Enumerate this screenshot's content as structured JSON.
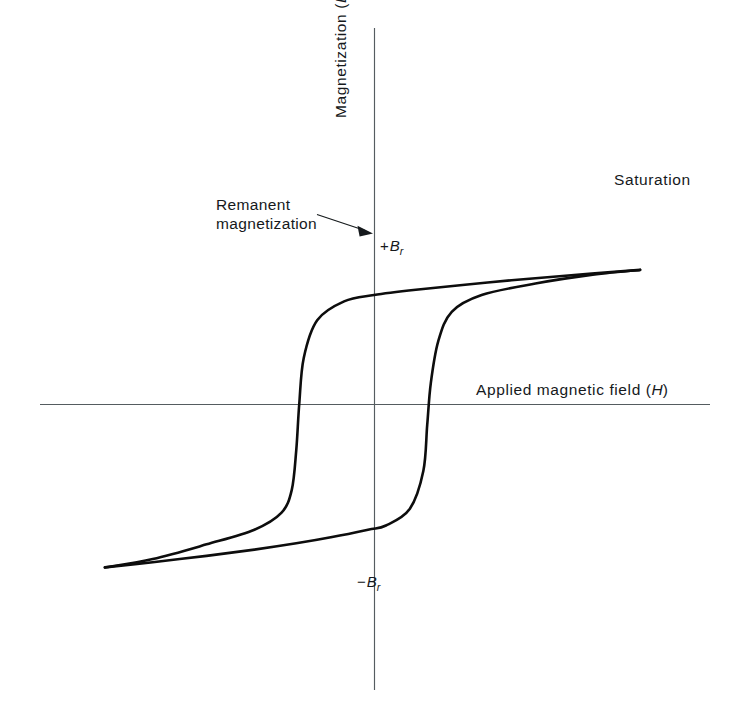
{
  "figure": {
    "kind": "hysteresis-loop-diagram",
    "background_color": "#ffffff",
    "ink_color": "#0d0d0d",
    "axis_color": "#555c60"
  },
  "axes": {
    "y_label_prefix": "Magnetization (",
    "y_label_symbol": "B",
    "y_label_suffix": ")",
    "y_label_full": "Magnetization (B)",
    "x_label_prefix": "Applied magnetic field (",
    "x_label_symbol": "H",
    "x_label_suffix": ")",
    "x_label_full": "Applied magnetic field (H)"
  },
  "annotations": {
    "saturation": "Saturation",
    "remanent_line1": "Remanent",
    "remanent_line2": "magnetization",
    "br_positive_sign": "+",
    "br_positive_symbol": "B",
    "br_positive_subscript": "r",
    "br_negative_sign": "−",
    "br_negative_symbol": "B",
    "br_negative_subscript": "r"
  },
  "chart_data": {
    "type": "line",
    "title": "",
    "subtitle": "",
    "xlabel": "Applied magnetic field (H)",
    "ylabel": "Magnetization (B)",
    "grid": false,
    "legend": "none",
    "axis_origin_px": {
      "x": 374,
      "y": 404
    },
    "axis_extent_px": {
      "x_axis_from": 40,
      "x_axis_to": 710,
      "y_axis_from": 28,
      "y_axis_to": 690
    },
    "xlim": [
      -1.0,
      1.0
    ],
    "ylim": [
      -1.0,
      1.0
    ],
    "annotations": [
      {
        "text": "Saturation",
        "x": 0.89,
        "y": 0.71,
        "points_to": [
          0.89,
          0.63
        ]
      },
      {
        "text": "Remanent magnetization",
        "x": -0.47,
        "y": 0.6,
        "points_to": [
          0.0,
          0.52
        ]
      },
      {
        "text": "+Br",
        "x": 0.02,
        "y": 0.45
      },
      {
        "text": "-Br",
        "x": -0.025,
        "y": -0.52
      }
    ],
    "key_points": {
      "positive_saturation": {
        "x": 0.89,
        "y": 0.64
      },
      "negative_saturation": {
        "x": -0.9,
        "y": -0.78
      },
      "remanence_positive": {
        "x": 0.0,
        "y": 0.52
      },
      "remanence_negative": {
        "x": 0.0,
        "y": -0.58
      },
      "coercivity_negative": {
        "x": -0.245,
        "y": 0.0
      },
      "coercivity_positive": {
        "x": 0.175,
        "y": 0.0
      }
    },
    "series": [
      {
        "name": "descending branch",
        "direction": "from positive saturation to negative saturation",
        "x": [
          0.89,
          0.62,
          0.38,
          0.14,
          0.0,
          -0.1,
          -0.19,
          -0.235,
          -0.25,
          -0.26,
          -0.275,
          -0.31,
          -0.4,
          -0.56,
          -0.74,
          -0.9
        ],
        "y": [
          0.64,
          0.61,
          0.58,
          0.545,
          0.52,
          0.49,
          0.4,
          0.22,
          0.0,
          -0.22,
          -0.41,
          -0.52,
          -0.6,
          -0.67,
          -0.74,
          -0.78
        ]
      },
      {
        "name": "ascending branch",
        "direction": "from negative saturation to positive saturation",
        "x": [
          -0.9,
          -0.74,
          -0.56,
          -0.4,
          -0.26,
          -0.14,
          -0.02,
          0.04,
          0.12,
          0.165,
          0.178,
          0.19,
          0.215,
          0.26,
          0.36,
          0.54,
          0.72,
          0.89
        ],
        "y": [
          -0.78,
          -0.755,
          -0.725,
          -0.695,
          -0.665,
          -0.635,
          -0.6,
          -0.58,
          -0.5,
          -0.32,
          -0.1,
          0.1,
          0.3,
          0.44,
          0.52,
          0.575,
          0.615,
          0.64
        ]
      }
    ]
  }
}
